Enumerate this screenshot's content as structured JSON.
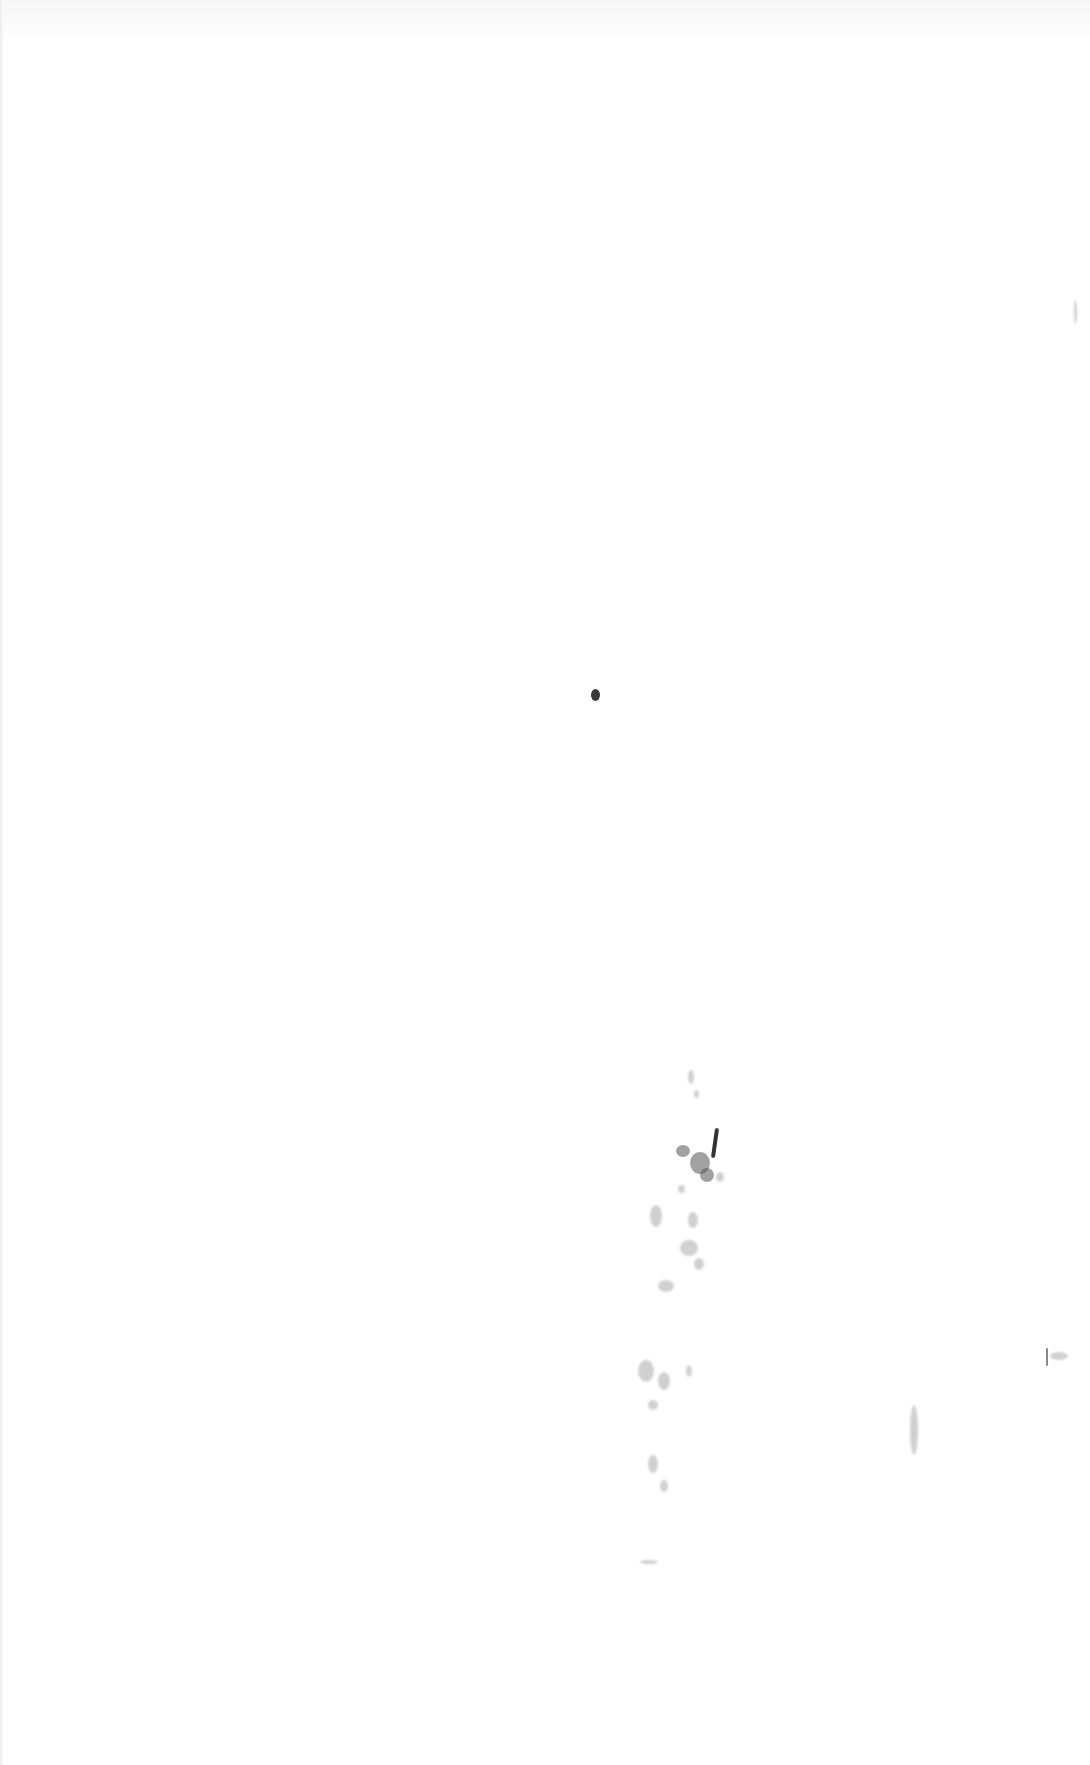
{
  "page": {
    "type": "scanned-blank-page",
    "background": "#ffffff",
    "text": ""
  },
  "marks": {
    "ink_dot": {
      "x": 595,
      "y": 695,
      "w": 9,
      "h": 12,
      "color": "#3a3a3a"
    },
    "speckle_cluster_color": "#555555",
    "edge_mark_color": "#999999"
  }
}
